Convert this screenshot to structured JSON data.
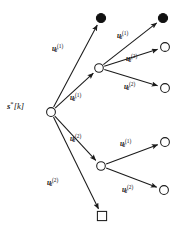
{
  "figure": {
    "type": "tree-diagram",
    "width": 181,
    "height": 237,
    "background": "#ffffff",
    "ink_color": "#111111",
    "root_label": {
      "base": "s",
      "superscript": "*",
      "bracket": "[k]",
      "plain": "s*[k]"
    }
  },
  "nodes": [
    {
      "id": "root",
      "shape": "open-circle",
      "x": 51,
      "y": 112,
      "r": 4.4
    },
    {
      "id": "n-a",
      "shape": "filled-circle",
      "x": 101,
      "y": 18,
      "r": 4.6
    },
    {
      "id": "n-b",
      "shape": "open-circle",
      "x": 99,
      "y": 68,
      "r": 4.3
    },
    {
      "id": "n-c",
      "shape": "open-circle",
      "x": 101,
      "y": 166,
      "r": 4.3
    },
    {
      "id": "n-d",
      "shape": "square",
      "x": 102,
      "y": 216,
      "r": 4.6
    },
    {
      "id": "n-b1",
      "shape": "filled-circle",
      "x": 163,
      "y": 18,
      "r": 4.6
    },
    {
      "id": "n-b2",
      "shape": "open-circle",
      "x": 165,
      "y": 47,
      "r": 4.4
    },
    {
      "id": "n-b3",
      "shape": "open-circle",
      "x": 165,
      "y": 88,
      "r": 4.4
    },
    {
      "id": "n-c1",
      "shape": "open-circle",
      "x": 165,
      "y": 142,
      "r": 4.4
    },
    {
      "id": "n-c2",
      "shape": "open-circle",
      "x": 164,
      "y": 190,
      "r": 4.4
    }
  ],
  "edges": [
    {
      "id": "e-root-a",
      "from": "root",
      "to": "n-a",
      "label": {
        "base": "u",
        "sub": "d",
        "sup": "(1)",
        "plain": "u_d^(1)"
      },
      "label_x": 52,
      "label_y": 44
    },
    {
      "id": "e-root-b",
      "from": "root",
      "to": "n-b",
      "label": {
        "base": "u",
        "sub": "d",
        "sup": "(1)",
        "plain": "u_d^(1)"
      },
      "label_x": 70,
      "label_y": 93
    },
    {
      "id": "e-root-c",
      "from": "root",
      "to": "n-c",
      "label": {
        "base": "u",
        "sub": "d",
        "sup": "(2)",
        "plain": "u_d^(2)"
      },
      "label_x": 70,
      "label_y": 134
    },
    {
      "id": "e-root-d",
      "from": "root",
      "to": "n-d",
      "label": {
        "base": "u",
        "sub": "d",
        "sup": "(2)",
        "plain": "u_d^(2)"
      },
      "label_x": 47,
      "label_y": 178
    },
    {
      "id": "e-b-b1",
      "from": "n-b",
      "to": "n-b1",
      "label": {
        "base": "u",
        "sub": "d",
        "sup": "(1)",
        "plain": "u_d^(1)"
      },
      "label_x": 117,
      "label_y": 31
    },
    {
      "id": "e-b-b2",
      "from": "n-b",
      "to": "n-b2",
      "label": {
        "base": "u",
        "sub": "d",
        "sup": "(2)",
        "plain": "u_d^(2)"
      },
      "label_x": 126,
      "label_y": 54
    },
    {
      "id": "e-b-b3",
      "from": "n-b",
      "to": "n-b3",
      "label": {
        "base": "u",
        "sub": "d",
        "sup": "(2)",
        "plain": "u_d^(2)"
      },
      "label_x": 124,
      "label_y": 82
    },
    {
      "id": "e-c-c1",
      "from": "n-c",
      "to": "n-c1",
      "label": {
        "base": "u",
        "sub": "d",
        "sup": "(1)",
        "plain": "u_d^(1)"
      },
      "label_x": 120,
      "label_y": 139
    },
    {
      "id": "e-c-c2",
      "from": "n-c",
      "to": "n-c2",
      "label": {
        "base": "u",
        "sub": "d",
        "sup": "(2)",
        "plain": "u_d^(2)"
      },
      "label_x": 122,
      "label_y": 185
    }
  ]
}
